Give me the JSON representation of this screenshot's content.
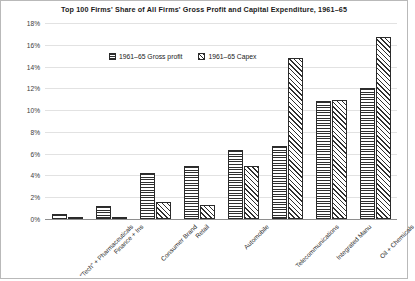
{
  "chart_data": {
    "type": "bar",
    "title": "Top 100 Firms' Share of All Firms' Gross Profit and Capital Expenditure, 1961–65",
    "xlabel": "",
    "ylabel": "",
    "ylim": [
      0,
      18
    ],
    "ytick_labels": [
      "0%",
      "2%",
      "4%",
      "6%",
      "8%",
      "10%",
      "12%",
      "14%",
      "16%",
      "18%"
    ],
    "ytick_values": [
      0,
      2,
      4,
      6,
      8,
      10,
      12,
      14,
      16,
      18
    ],
    "grid": true,
    "legend_position": "upper-left-inside",
    "categories": [
      "“Tech” + Pharmaceuticals",
      "Finance + Ins",
      "Consumer Brand",
      "Retail",
      "Automobile",
      "Telecommunications",
      "Integrated Manu",
      "Oil + Chemicals"
    ],
    "series": [
      {
        "name": "1961–65 Gross profit",
        "pattern": "horizontal-lines",
        "values": [
          0.5,
          1.2,
          4.2,
          4.9,
          6.3,
          6.7,
          10.8,
          12.0
        ]
      },
      {
        "name": "1961–65 Capex",
        "pattern": "diagonal-lines",
        "values": [
          0.1,
          0.1,
          1.55,
          1.25,
          4.85,
          14.8,
          10.9,
          16.7
        ]
      }
    ]
  },
  "colors": {
    "hatch": "#2f2f2f",
    "bar_border": "#2b2b2b",
    "grid": "#e2e2e2",
    "axis": "#8e8e8e",
    "text": "#1a1a1a",
    "figure_border": "#b9b9b9",
    "background": "#ffffff"
  }
}
